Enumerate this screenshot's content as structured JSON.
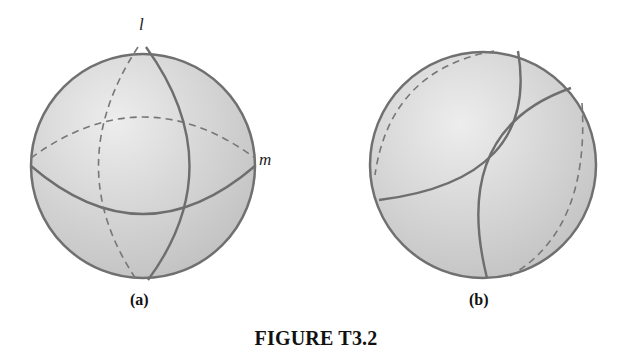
{
  "figure": {
    "caption": "FIGURE T3.2",
    "colors": {
      "sphere_fill_light": "#e4e4e4",
      "sphere_fill_dark": "#bdbdbd",
      "stroke": "#6e6e6e",
      "text": "#111111"
    },
    "panels": [
      {
        "id": "a",
        "label": "(a)",
        "description": "Sphere with two great circles l and m intersecting; back halves drawn dashed",
        "lines": [
          {
            "name": "l",
            "label": "l",
            "kind": "great circle (vertical)"
          },
          {
            "name": "m",
            "label": "m",
            "kind": "great circle (horizontal)"
          }
        ]
      },
      {
        "id": "b",
        "label": "(b)",
        "description": "Sphere with two non-intersecting circles (curved arcs), back portions dashed"
      }
    ]
  }
}
